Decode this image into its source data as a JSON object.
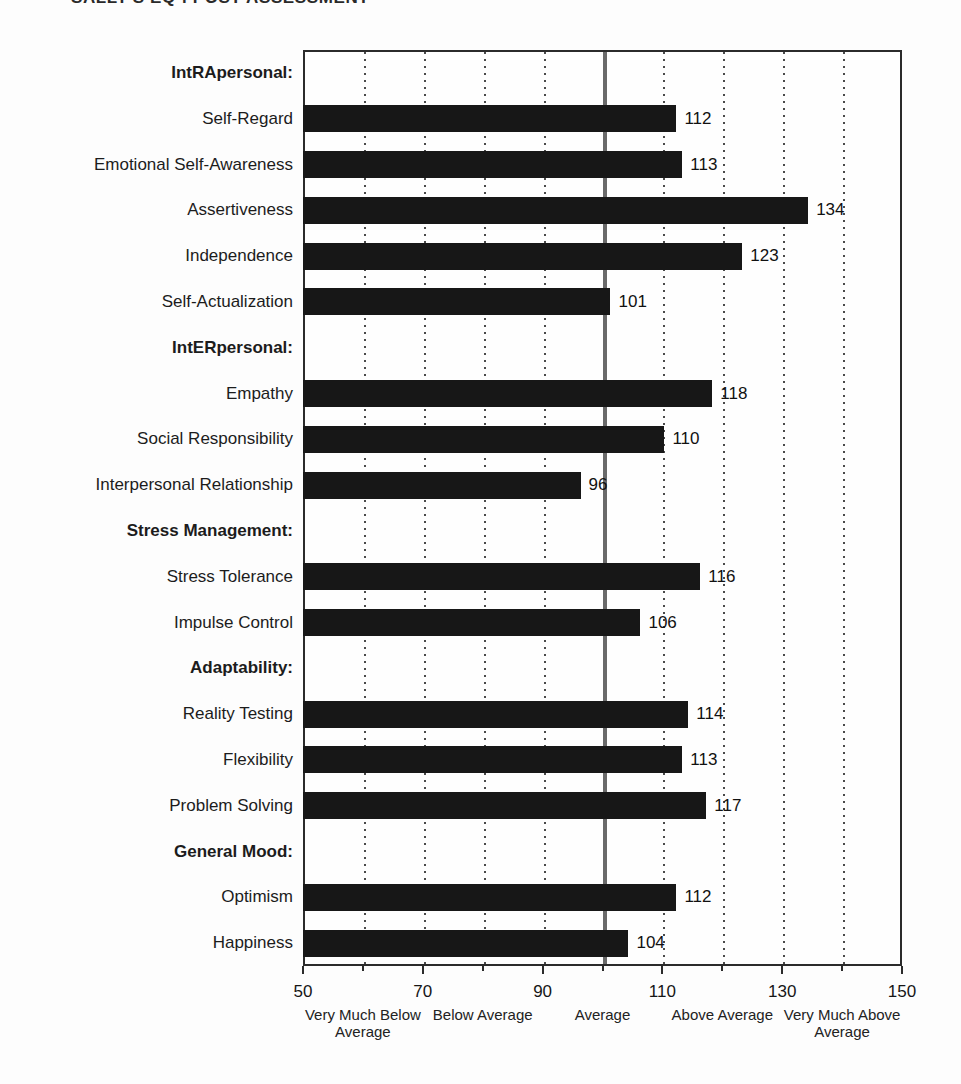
{
  "page": {
    "running_head": "SALLY'S EQ-i POST ASSESSMENT"
  },
  "chart_data": {
    "type": "bar",
    "orientation": "horizontal",
    "title": "SALLY'S EQ-i POST ASSESSMENT",
    "xlabel": "",
    "ylabel": "",
    "xlim": [
      50,
      150
    ],
    "x_major_ticks": [
      50,
      70,
      90,
      110,
      130,
      150
    ],
    "x_minor_ticks": [
      60,
      80,
      100,
      120,
      140
    ],
    "gridline_values": [
      60,
      70,
      80,
      90,
      110,
      120,
      130,
      140
    ],
    "grid": "vertical-dotted",
    "legend": "none",
    "reference_line_value": 100,
    "scale_descriptors": [
      {
        "value": 60,
        "label": "Very Much Below Average"
      },
      {
        "value": 80,
        "label": "Below Average"
      },
      {
        "value": 100,
        "label": "Average"
      },
      {
        "value": 120,
        "label": "Above Average"
      },
      {
        "value": 140,
        "label": "Very Much Above Average"
      }
    ],
    "groups": [
      {
        "header": "IntRApersonal:",
        "items": [
          {
            "label": "Self-Regard",
            "value": 112
          },
          {
            "label": "Emotional Self-Awareness",
            "value": 113
          },
          {
            "label": "Assertiveness",
            "value": 134
          },
          {
            "label": "Independence",
            "value": 123
          },
          {
            "label": "Self-Actualization",
            "value": 101
          }
        ]
      },
      {
        "header": "IntERpersonal:",
        "items": [
          {
            "label": "Empathy",
            "value": 118
          },
          {
            "label": "Social Responsibility",
            "value": 110
          },
          {
            "label": "Interpersonal Relationship",
            "value": 96
          }
        ]
      },
      {
        "header": "Stress Management:",
        "items": [
          {
            "label": "Stress Tolerance",
            "value": 116
          },
          {
            "label": "Impulse Control",
            "value": 106
          }
        ]
      },
      {
        "header": "Adaptability:",
        "items": [
          {
            "label": "Reality Testing",
            "value": 114
          },
          {
            "label": "Flexibility",
            "value": 113
          },
          {
            "label": "Problem Solving",
            "value": 117
          }
        ]
      },
      {
        "header": "General Mood:",
        "items": [
          {
            "label": "Optimism",
            "value": 112
          },
          {
            "label": "Happiness",
            "value": 104
          }
        ]
      }
    ],
    "colors": {
      "bar": "#171717",
      "reference_line": "#6a6a6a",
      "gridline": "#4a4a4a",
      "plot_border": "#2b2b2b",
      "text": "#1c1c1c"
    }
  }
}
